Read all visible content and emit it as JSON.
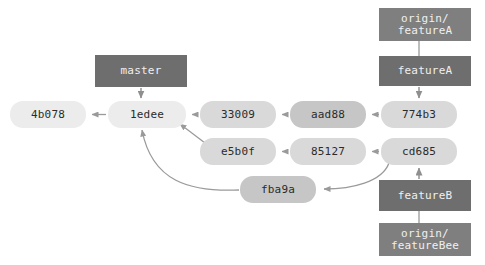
{
  "diagram": {
    "background_color": "#ffffff",
    "edge_color": "#9a9a9a",
    "commit_text_color": "#2b2b2b",
    "label_text_color": "#f0f0f0"
  },
  "commits": [
    {
      "id": "4b078",
      "label": "4b078",
      "x": 10,
      "y": 101,
      "w": 76,
      "h": 27,
      "color": "#ececec"
    },
    {
      "id": "1edee",
      "label": "1edee",
      "x": 108,
      "y": 101,
      "w": 78,
      "h": 27,
      "color": "#ececec"
    },
    {
      "id": "33009",
      "label": "33009",
      "x": 200,
      "y": 101,
      "w": 76,
      "h": 27,
      "color": "#d9d9d9"
    },
    {
      "id": "aad88",
      "label": "aad88",
      "x": 290,
      "y": 101,
      "w": 76,
      "h": 27,
      "color": "#c6c6c6"
    },
    {
      "id": "774b3",
      "label": "774b3",
      "x": 381,
      "y": 101,
      "w": 76,
      "h": 27,
      "color": "#d9d9d9"
    },
    {
      "id": "e5b0f",
      "label": "e5b0f",
      "x": 200,
      "y": 138,
      "w": 76,
      "h": 27,
      "color": "#d9d9d9"
    },
    {
      "id": "85127",
      "label": "85127",
      "x": 290,
      "y": 138,
      "w": 76,
      "h": 27,
      "color": "#d9d9d9"
    },
    {
      "id": "cd685",
      "label": "cd685",
      "x": 381,
      "y": 138,
      "w": 76,
      "h": 27,
      "color": "#d9d9d9"
    },
    {
      "id": "fba9a",
      "label": "fba9a",
      "x": 240,
      "y": 176,
      "w": 76,
      "h": 27,
      "color": "#c6c6c6"
    }
  ],
  "labels": [
    {
      "id": "origin-featureA",
      "label": "origin/\nfeatureA",
      "x": 379,
      "y": 8,
      "w": 92,
      "h": 33,
      "color": "#7f7f7f"
    },
    {
      "id": "featureA",
      "label": "featureA",
      "x": 379,
      "y": 56,
      "w": 92,
      "h": 30,
      "color": "#6e6e6e"
    },
    {
      "id": "master",
      "label": "master",
      "x": 95,
      "y": 55,
      "w": 92,
      "h": 32,
      "color": "#6e6e6e"
    },
    {
      "id": "featureB",
      "label": "featureB",
      "x": 379,
      "y": 180,
      "w": 92,
      "h": 31,
      "color": "#6e6e6e"
    },
    {
      "id": "origin-featureBee",
      "label": "origin/\nfeatureBee",
      "x": 379,
      "y": 223,
      "w": 92,
      "h": 33,
      "color": "#7f7f7f"
    }
  ],
  "edges": [
    {
      "from": "1edee",
      "to": "4b078",
      "kind": "parent-arrow"
    },
    {
      "from": "33009",
      "to": "1edee",
      "kind": "parent-arrow"
    },
    {
      "from": "aad88",
      "to": "33009",
      "kind": "parent-arrow"
    },
    {
      "from": "774b3",
      "to": "aad88",
      "kind": "parent-arrow"
    },
    {
      "from": "e5b0f",
      "to": "1edee",
      "kind": "parent-arrow-diagonal"
    },
    {
      "from": "85127",
      "to": "e5b0f",
      "kind": "parent-arrow"
    },
    {
      "from": "cd685",
      "to": "85127",
      "kind": "parent-arrow"
    },
    {
      "from": "cd685",
      "to": "fba9a",
      "kind": "parent-arrow-curved"
    },
    {
      "from": "fba9a",
      "to": "1edee",
      "kind": "parent-arrow-curved"
    },
    {
      "from": "master",
      "to": "1edee",
      "kind": "label-pointer"
    },
    {
      "from": "featureA",
      "to": "774b3",
      "kind": "label-pointer"
    },
    {
      "from": "featureB",
      "to": "cd685",
      "kind": "label-pointer"
    },
    {
      "from": "origin-featureA",
      "to": "featureA",
      "kind": "label-connector"
    },
    {
      "from": "origin-featureBee",
      "to": "featureB",
      "kind": "label-connector"
    }
  ]
}
